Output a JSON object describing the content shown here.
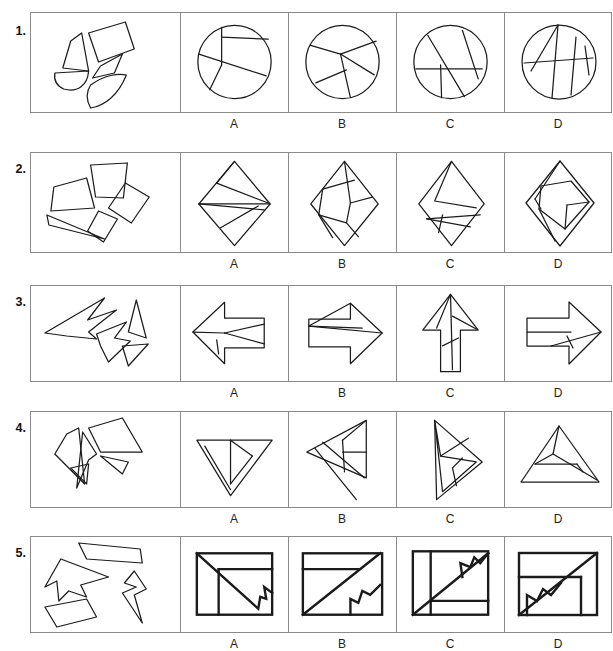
{
  "worksheet": {
    "kind": "shape-assembly-puzzle",
    "option_labels": [
      "A",
      "B",
      "C",
      "D"
    ],
    "rows": [
      {
        "number": "1.",
        "pieces_label": "scattered circle pieces",
        "target_shape": "circle",
        "options": [
          {
            "label": "A",
            "figure": "circle divided by one vertical chord, one short horizontal chord and one long diagonal chord"
          },
          {
            "label": "B",
            "figure": "circle divided by chords meeting at an off-centre point near the top"
          },
          {
            "label": "C",
            "figure": "circle divided by two steep chords and one horizontal chord"
          },
          {
            "label": "D",
            "figure": "circle divided by a near-vertical chord, a horizontal chord and two slanted chords"
          }
        ]
      },
      {
        "number": "2.",
        "pieces_label": "scattered quadrilateral pieces",
        "target_shape": "rhombus",
        "options": [
          {
            "label": "A",
            "figure": "tall rhombus split by a horizontal line and two triangles in the upper half"
          },
          {
            "label": "B",
            "figure": "tall rhombus containing a tilted inner square and two bands"
          },
          {
            "label": "C",
            "figure": "tall rhombus with an inner triangle and two slivers at the bottom"
          },
          {
            "label": "D",
            "figure": "tall rhombus with an inner tilted square and a narrow sliver at the left"
          }
        ]
      },
      {
        "number": "3.",
        "pieces_label": "scattered arrow-head pieces",
        "target_shape": "arrow",
        "options": [
          {
            "label": "A",
            "figure": "left-pointing arrow split into a head triangle and shaft bands"
          },
          {
            "label": "B",
            "figure": "right-pointing arrow split by a long thin sliver across the shaft"
          },
          {
            "label": "C",
            "figure": "up-pointing arrow split into head triangles and a narrow shaft"
          },
          {
            "label": "D",
            "figure": "right-pointing arrow split into a head triangle and two shaft bands"
          }
        ]
      },
      {
        "number": "4.",
        "pieces_label": "scattered elongated triangle pieces",
        "target_shape": "triangle",
        "options": [
          {
            "label": "A",
            "figure": "downward triangle with a flat top edge split into three slivers"
          },
          {
            "label": "B",
            "figure": "left-leaning triangle split into a long sliver and inner bands"
          },
          {
            "label": "C",
            "figure": "right-leaning triangle split into narrow bands along the left edge"
          },
          {
            "label": "D",
            "figure": "wide flat triangle split into three horizontal bands"
          }
        ]
      },
      {
        "number": "5.",
        "pieces_label": "scattered notched polygon pieces",
        "target_shape": "square",
        "options": [
          {
            "label": "A",
            "figure": "square with a notched diagonal from top-left to bottom-right, one horizontal and one vertical line"
          },
          {
            "label": "B",
            "figure": "square with a notched diagonal from bottom-left to top-right and a horizontal line near the top"
          },
          {
            "label": "C",
            "figure": "square with a notched diagonal from bottom-left to top-right, a left vertical line and a low horizontal line"
          },
          {
            "label": "D",
            "figure": "square with a notched diagonal from bottom-left to top-right, a horizontal line and a right vertical line"
          }
        ]
      }
    ]
  }
}
